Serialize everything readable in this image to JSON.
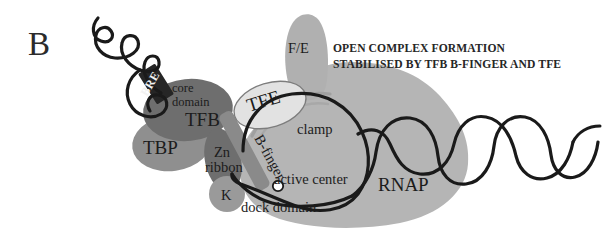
{
  "figure": {
    "panel_letter": "B",
    "title_line_1": "OPEN COMPLEX FORMATION",
    "title_line_2": "STABILISED BY TFB B-FINGER AND TFE"
  },
  "labels": {
    "bre": "BRE",
    "core_domain_line1": "core",
    "core_domain_line2": "domain",
    "tfb": "TFB",
    "tbp": "TBP",
    "tfe": "TFE",
    "fe": "F/E",
    "b_finger": "B-finger",
    "zn_line1": "Zn",
    "zn_line2": "ribbon",
    "k": "K",
    "clamp": "clamp",
    "active_center": "active center",
    "dock_domain": "dock domain",
    "rnap": "RNAP"
  },
  "colors": {
    "rnap_body": "#b5b5b5",
    "fe_lobe": "#b0b0b0",
    "tfb_core": "#6e6e6e",
    "tbp": "#8f8f8f",
    "zn_ribbon": "#6e6e6e",
    "k_subunit": "#9a9a9a",
    "tfe_fill": "#e2e2e2",
    "tfe_stroke": "#7d7d7d",
    "b_finger": "#8a8a8a",
    "bre_box": "#262626",
    "dna": "#1a1a1a",
    "text": "#1c1c1c",
    "background": "#ffffff"
  }
}
